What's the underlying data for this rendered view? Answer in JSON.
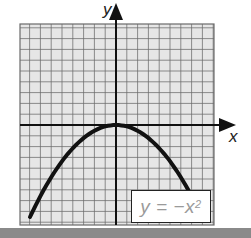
{
  "chart_data": {
    "type": "line",
    "title": "",
    "equation_label": "y = −x²",
    "xlabel": "x",
    "ylabel": "y",
    "grid": true,
    "legend": {
      "position": "bottom-right",
      "entries": [
        "y = −x²"
      ]
    },
    "series": [
      {
        "name": "y = −x²",
        "x": [
          -2.0,
          -1.5,
          -1.0,
          -0.5,
          0.0,
          0.5,
          1.0,
          1.5,
          1.75
        ],
        "y": [
          -4.0,
          -2.25,
          -1.0,
          -0.25,
          0.0,
          -0.25,
          -1.0,
          -2.25,
          -3.06
        ]
      }
    ],
    "vertex": [
      0,
      0
    ],
    "opens": "downward"
  },
  "labels": {
    "x_axis": "x",
    "y_axis": "y",
    "equation_prefix": "y = −x",
    "equation_exponent": "2"
  },
  "colors": {
    "grid_background": "#e6e6e6",
    "grid_lines": "#6b6b6b",
    "axes": "#111111",
    "curve": "#111111",
    "label_text": "#9a9a9a",
    "bottom_bar": "#8a8a8a"
  },
  "layout": {
    "plot_left": 20,
    "plot_top": 24,
    "plot_right": 214,
    "plot_bottom": 225,
    "origin_x": 116,
    "origin_y": 125,
    "cell_px": 10.8,
    "x_unit_px": 43,
    "y_unit_px": 23
  }
}
